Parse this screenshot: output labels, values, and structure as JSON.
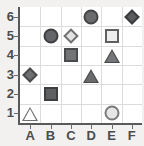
{
  "chart_data": {
    "type": "scatter",
    "title": "",
    "xlabel": "",
    "ylabel": "",
    "grid": true,
    "legend": "none",
    "categories": [
      "A",
      "B",
      "C",
      "D",
      "E",
      "F"
    ],
    "y_ticks": [
      "1",
      "2",
      "3",
      "4",
      "5",
      "6"
    ],
    "xlim": [
      "A",
      "F"
    ],
    "ylim": [
      0.5,
      6.5
    ],
    "points": [
      {
        "x": "A",
        "y": 1,
        "shape": "triangle",
        "fill": "#ffffff",
        "stroke": "#6f7072",
        "label": "A1"
      },
      {
        "x": "A",
        "y": 3,
        "shape": "diamond",
        "fill": "#6e6f71",
        "stroke": "#4a4b4d",
        "label": "A3"
      },
      {
        "x": "B",
        "y": 2,
        "shape": "square",
        "fill": "#5f6062",
        "stroke": "#3d3e40",
        "label": "B2"
      },
      {
        "x": "B",
        "y": 5,
        "shape": "circle",
        "fill": "#646568",
        "stroke": "#3f4042",
        "label": "B5"
      },
      {
        "x": "C",
        "y": 4,
        "shape": "square",
        "fill": "#737476",
        "stroke": "#4a4b4d",
        "label": "C4"
      },
      {
        "x": "C",
        "y": 5,
        "shape": "diamond",
        "fill": "#e2e2e2",
        "stroke": "#6f7072",
        "label": "C5"
      },
      {
        "x": "D",
        "y": 3,
        "shape": "triangle",
        "fill": "#6a6b6d",
        "stroke": "#4a4b4d",
        "label": "D3"
      },
      {
        "x": "D",
        "y": 6,
        "shape": "circle",
        "fill": "#6a6b6d",
        "stroke": "#454648",
        "label": "D6"
      },
      {
        "x": "E",
        "y": 1,
        "shape": "circle",
        "fill": "#e6e6e6",
        "stroke": "#7a7b7d",
        "label": "E1"
      },
      {
        "x": "E",
        "y": 4,
        "shape": "triangle",
        "fill": "#75767a",
        "stroke": "#4a4b4d",
        "label": "E4"
      },
      {
        "x": "E",
        "y": 5,
        "shape": "square",
        "fill": "#ededed",
        "stroke": "#5f6062",
        "label": "E5"
      },
      {
        "x": "F",
        "y": 6,
        "shape": "diamond",
        "fill": "#5a5b5d",
        "stroke": "#3a3b3d",
        "label": "F6"
      }
    ]
  },
  "axes": {
    "x_labels": [
      "A",
      "B",
      "C",
      "D",
      "E",
      "F"
    ],
    "y_labels": [
      "6",
      "5",
      "4",
      "3",
      "2",
      "1"
    ]
  },
  "colors": {
    "background": "#f2f1ef",
    "plot_background": "#ffffff",
    "gridline": "#dcdcdc",
    "axis": "#58595b",
    "tick_label": "#4b4c4e"
  }
}
